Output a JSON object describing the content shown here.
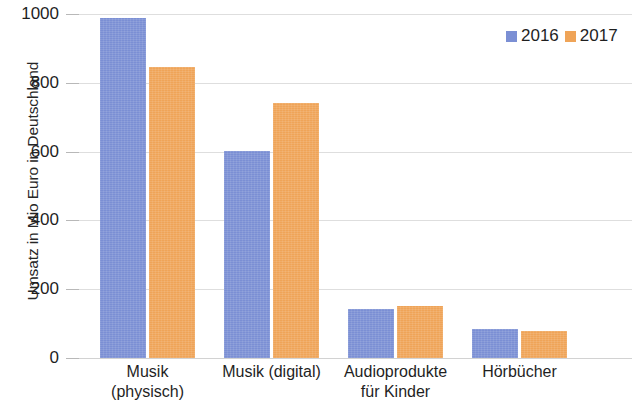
{
  "chart_data": {
    "type": "bar",
    "title": "",
    "xlabel": "",
    "ylabel": "Umsatz in Mio Euro in Deutschland",
    "ylim": [
      0,
      1000
    ],
    "ytick_labels": [
      "1000",
      "800",
      "600",
      "400",
      "200",
      "0"
    ],
    "ytick_values": [
      1000,
      800,
      600,
      400,
      200,
      0
    ],
    "grid": true,
    "legend_position": "top-right",
    "categories": [
      "Musik (physisch)",
      "Musik (digital)",
      "Audioprodukte für Kinder",
      "Hörbücher"
    ],
    "category_lines": [
      [
        "Musik",
        "(physisch)"
      ],
      [
        "Musik (digital)",
        ""
      ],
      [
        "Audioprodukte",
        "für Kinder"
      ],
      [
        "Hörbücher",
        ""
      ]
    ],
    "series": [
      {
        "name": "2016",
        "color": "#7b8fd4",
        "values": [
          988,
          603,
          143,
          85
        ]
      },
      {
        "name": "2017",
        "color": "#efa458",
        "values": [
          845,
          740,
          152,
          78
        ]
      }
    ]
  },
  "legend": {
    "items": [
      {
        "label": "2016",
        "color": "#7b8fd4"
      },
      {
        "label": "2017",
        "color": "#efa458"
      }
    ]
  }
}
